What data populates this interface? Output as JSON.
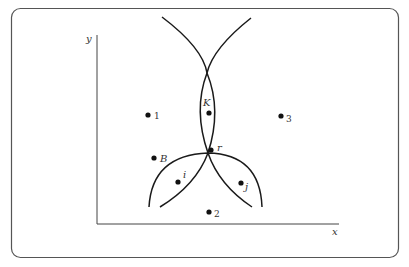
{
  "figure": {
    "axes": {
      "x_label": "x",
      "y_label": "y"
    },
    "points": [
      {
        "id": "1",
        "label": "1",
        "style": "upright",
        "cx": 148,
        "cy": 115,
        "lx": 154,
        "ly": 119
      },
      {
        "id": "K",
        "label": "K",
        "style": "italic",
        "cx": 209,
        "cy": 113,
        "lx": 203,
        "ly": 107
      },
      {
        "id": "3",
        "label": "3",
        "style": "upright",
        "cx": 281,
        "cy": 116,
        "lx": 286,
        "ly": 121
      },
      {
        "id": "B",
        "label": "B",
        "style": "italic",
        "cx": 154,
        "cy": 158,
        "lx": 160,
        "ly": 162
      },
      {
        "id": "r",
        "label": "r",
        "style": "italic",
        "cx": 210,
        "cy": 150,
        "lx": 217,
        "ly": 151
      },
      {
        "id": "i",
        "label": "i",
        "style": "italic",
        "cx": 178,
        "cy": 182,
        "lx": 183,
        "ly": 178
      },
      {
        "id": "j",
        "label": "j",
        "style": "italic",
        "cx": 241,
        "cy": 183,
        "lx": 245,
        "ly": 189
      },
      {
        "id": "2",
        "label": "2",
        "style": "upright",
        "cx": 209,
        "cy": 212,
        "lx": 214,
        "ly": 217
      }
    ],
    "colors": {
      "stroke": "#1a1a1a",
      "frame": "#555555",
      "text": "#333333"
    }
  }
}
